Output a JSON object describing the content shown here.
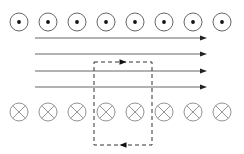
{
  "figure": {
    "title": "",
    "width": 244,
    "height": 154,
    "background": "#ffffff"
  },
  "chart_data": {
    "type": "diagram",
    "title": "",
    "subtitle": "",
    "xlabel": "",
    "ylabel": "",
    "elements": [
      {
        "name": "field-out-of-page-row",
        "symbol": "dot-in-circle",
        "meaning": "magnetic field out of page",
        "count": 8,
        "row_y": 22,
        "start_x": 19,
        "spacing_x": 29,
        "radius": 9,
        "dot_radius": 1.9,
        "stroke": "#555555",
        "stroke_width": 0.9,
        "centers_x": [
          19,
          48,
          77,
          106,
          135,
          164,
          193,
          222
        ]
      },
      {
        "name": "field-into-page-row",
        "symbol": "cross-in-circle",
        "meaning": "magnetic field into page",
        "count": 8,
        "row_y": 112,
        "start_x": 19,
        "spacing_x": 29,
        "radius": 9,
        "stroke": "#888888",
        "stroke_width": 0.9,
        "centers_x": [
          19,
          48,
          77,
          106,
          135,
          164,
          193,
          222
        ]
      },
      {
        "name": "horizontal-field-arrows",
        "symbol": "arrow-right",
        "meaning": "field lines pointing right",
        "count": 4,
        "x_start": 35,
        "x_end": 207,
        "ys": [
          38,
          54,
          71,
          87
        ],
        "stroke": "#666666",
        "stroke_width": 1.0,
        "arrowhead_length": 7,
        "arrowhead_width": 5,
        "arrowhead_fill": "#222222"
      },
      {
        "name": "dashed-current-loop",
        "symbol": "dashed-rectangle",
        "meaning": "rectangular conducting loop / Amperian loop",
        "x_left": 94,
        "x_right": 152,
        "y_top": 62,
        "y_bottom": 145,
        "stroke": "#333333",
        "stroke_width": 1.0,
        "dash_pattern": "4,3"
      },
      {
        "name": "loop-top-direction-arrow",
        "symbol": "arrow-right",
        "meaning": "current direction along top edge (rightward)",
        "x": 123,
        "y": 62,
        "direction": "right",
        "fill": "#111111"
      },
      {
        "name": "loop-bottom-direction-arrow",
        "symbol": "arrow-left",
        "meaning": "current direction along bottom edge (leftward)",
        "x": 123,
        "y": 145,
        "direction": "left",
        "fill": "#111111"
      }
    ],
    "colors": {
      "background": "#ffffff",
      "dot_circle_stroke": "#555555",
      "cross_circle_stroke": "#888888",
      "arrow_line_stroke": "#666666",
      "arrowhead_fill": "#222222",
      "dashed_loop_stroke": "#333333"
    },
    "legend": [],
    "annotations": []
  }
}
